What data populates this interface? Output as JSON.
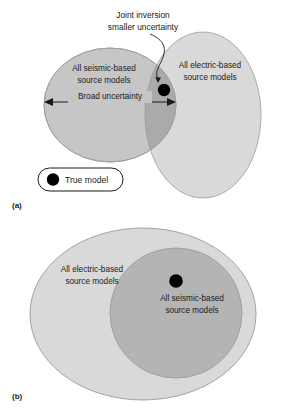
{
  "figure": {
    "colors": {
      "seismic_fill": "#c6c6c6",
      "electric_fill": "#d9d9d9",
      "overlap_fill": "#adadad",
      "outline": "#8a8a8a",
      "true_model_dot": "#000000",
      "background": "#ffffff",
      "text": "#1a1a1a"
    }
  },
  "panel_a": {
    "letter": "(a)",
    "seismic_label_line1": "All seismic-based",
    "seismic_label_line2": "source models",
    "electric_label_line1": "All electric-based",
    "electric_label_line2": "source models",
    "annotation_line1": "Joint inversion",
    "annotation_line2": "smaller uncertainty",
    "arrow_label": "Broad uncertainty",
    "legend": {
      "dot_name": "true-model-dot",
      "label": "True model"
    }
  },
  "panel_b": {
    "letter": "(b)",
    "electric_label_line1": "All electric-based",
    "electric_label_line2": "source models",
    "seismic_label_line1": "All seismic-based",
    "seismic_label_line2": "source models"
  }
}
